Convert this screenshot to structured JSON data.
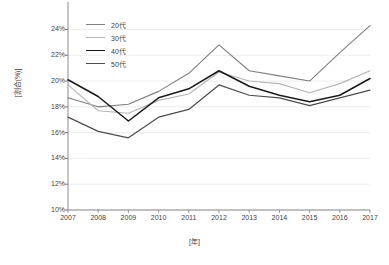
{
  "chart_data": {
    "type": "line",
    "title": "",
    "xlabel": "[年]",
    "ylabel": "[割合(%)]",
    "x": [
      2007,
      2008,
      2009,
      2010,
      2011,
      2012,
      2013,
      2014,
      2015,
      2016,
      2017
    ],
    "categories": [
      "2007",
      "2008",
      "2009",
      "2010",
      "2011",
      "2012",
      "2013",
      "2014",
      "2015",
      "2016",
      "2017"
    ],
    "xtick_labels": [
      "2007",
      "2008",
      "2009",
      "2010",
      "2011",
      "2012",
      "2013",
      "2014",
      "2015",
      "2016",
      "2017"
    ],
    "ytick_labels": [
      "10%",
      "12%",
      "14%",
      "16%",
      "18%",
      "20%",
      "22%",
      "24%"
    ],
    "ytick_values": [
      10,
      12,
      14,
      16,
      18,
      20,
      22,
      24
    ],
    "ylim": [
      10,
      25.2
    ],
    "xlim": [
      2007,
      2017
    ],
    "grid": "horizontal",
    "legend_position": "top-left",
    "series": [
      {
        "name": "20代",
        "color": "#7f7f7f",
        "width": 1.1,
        "values": [
          18.7,
          18.0,
          18.2,
          19.2,
          20.6,
          22.8,
          20.8,
          20.4,
          20.0,
          22.2,
          24.3
        ]
      },
      {
        "name": "30代",
        "color": "#b5b5b5",
        "width": 1.1,
        "values": [
          19.7,
          17.7,
          17.5,
          18.5,
          19.0,
          20.7,
          20.0,
          19.8,
          19.1,
          19.8,
          20.8
        ]
      },
      {
        "name": "40代",
        "color": "#1a1a1a",
        "width": 1.5,
        "values": [
          20.1,
          18.8,
          16.9,
          18.7,
          19.4,
          20.8,
          19.6,
          18.9,
          18.4,
          18.9,
          20.2
        ]
      },
      {
        "name": "50代",
        "color": "#4d4d4d",
        "width": 1.2,
        "values": [
          17.2,
          16.1,
          15.6,
          17.2,
          17.8,
          19.7,
          18.9,
          18.7,
          18.1,
          18.7,
          19.3
        ]
      }
    ]
  },
  "legend": {
    "items": [
      {
        "label": "20代"
      },
      {
        "label": "30代"
      },
      {
        "label": "40代"
      },
      {
        "label": "50代"
      }
    ]
  },
  "axes": {
    "y_title": "[割合(%)]",
    "x_title": "[年]"
  },
  "colors": {
    "axis": "#808080",
    "grid": "#e8e8e8",
    "text": "#3f3f3f",
    "background": "#ffffff"
  }
}
